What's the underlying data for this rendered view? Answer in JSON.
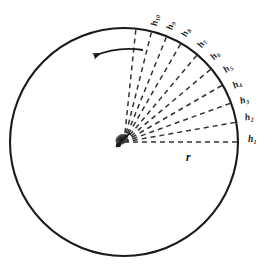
{
  "figure": {
    "background_color": "#ffffff",
    "stroke_color": "#1a1a1a",
    "dash_color": "#333333"
  },
  "circle": {
    "name": "outer-circle",
    "center_x": 124,
    "center_y": 142,
    "radius": 114,
    "stroke_width": 2.1
  },
  "hub": {
    "name": "center-hub",
    "x": 124,
    "y": 142,
    "description": "dark converging cluster at circle center"
  },
  "rotation_arrow": {
    "name": "counterclockwise-arrow",
    "direction": "counterclockwise",
    "start_x": 143,
    "start_y": 50,
    "end_x": 94,
    "end_y": 56
  },
  "radius_label": {
    "text": "r",
    "x": 186,
    "y": 152
  },
  "rays": [
    {
      "label": "h",
      "subscript": "1",
      "angle_deg": 0,
      "label_x": 248,
      "label_y": 135,
      "label_rot": 0
    },
    {
      "label": "h",
      "subscript": "2",
      "angle_deg": 10,
      "label_x": 245,
      "label_y": 113,
      "label_rot": 8
    },
    {
      "label": "h",
      "subscript": "3",
      "angle_deg": 20,
      "label_x": 240,
      "label_y": 96,
      "label_rot": 18
    },
    {
      "label": "h",
      "subscript": "4",
      "angle_deg": 30,
      "label_x": 233,
      "label_y": 80,
      "label_rot": 30
    },
    {
      "label": "h",
      "subscript": "5",
      "angle_deg": 40,
      "label_x": 224,
      "label_y": 64,
      "label_rot": 40
    },
    {
      "label": "h",
      "subscript": "6",
      "angle_deg": 50,
      "label_x": 211,
      "label_y": 51,
      "label_rot": 50
    },
    {
      "label": "h",
      "subscript": "7",
      "angle_deg": 60,
      "label_x": 198,
      "label_y": 39,
      "label_rot": 60
    },
    {
      "label": "h",
      "subscript": "8",
      "angle_deg": 68,
      "label_x": 182,
      "label_y": 28,
      "label_rot": 68
    },
    {
      "label": "h",
      "subscript": "9",
      "angle_deg": 76,
      "label_x": 167,
      "label_y": 21,
      "label_rot": 76
    },
    {
      "label": "h",
      "subscript": "10",
      "angle_deg": 84,
      "label_x": 150,
      "label_y": 16,
      "label_rot": 84
    }
  ]
}
